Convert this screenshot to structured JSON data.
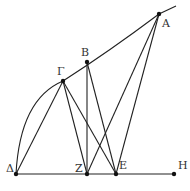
{
  "figure": {
    "type": "geometric-construction",
    "stroke_color": "#222222",
    "background": "#ffffff",
    "points": [
      {
        "id": "A",
        "label": "Α",
        "x": 159,
        "y": 14,
        "label_dx": 3,
        "label_dy": 13
      },
      {
        "id": "B",
        "label": "Β",
        "x": 87,
        "y": 62,
        "label_dx": -6,
        "label_dy": -6
      },
      {
        "id": "G",
        "label": "Γ",
        "x": 63,
        "y": 81,
        "label_dx": -6,
        "label_dy": -6
      },
      {
        "id": "D",
        "label": "Δ",
        "x": 16,
        "y": 174,
        "label_dx": -10,
        "label_dy": -2
      },
      {
        "id": "Z",
        "label": "Ζ",
        "x": 87,
        "y": 174,
        "label_dx": -12,
        "label_dy": -2
      },
      {
        "id": "E",
        "label": "Ε",
        "x": 116,
        "y": 174,
        "label_dx": 3,
        "label_dy": -5
      },
      {
        "id": "H",
        "label": "Η",
        "x": 174,
        "y": 174,
        "label_dx": 4,
        "label_dy": -5
      }
    ],
    "segments": [
      [
        "D",
        "H"
      ],
      [
        "G",
        "D"
      ],
      [
        "G",
        "Z"
      ],
      [
        "G",
        "E"
      ],
      [
        "B",
        "Z"
      ],
      [
        "B",
        "E"
      ],
      [
        "A",
        "Z"
      ],
      [
        "A",
        "E"
      ]
    ],
    "curves": [
      {
        "name": "arc-delta-alpha",
        "from": "D",
        "through": "G",
        "to": "A",
        "extends_to": {
          "x": 176,
          "y": 6
        }
      }
    ]
  }
}
